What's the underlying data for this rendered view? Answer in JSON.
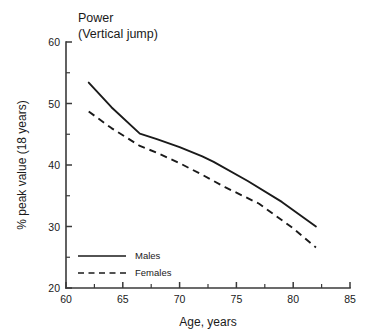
{
  "chart_data": {
    "type": "line",
    "title": "Power",
    "subtitle": "(Vertical jump)",
    "xlabel": "Age, years",
    "ylabel": "% peak value (18 years)",
    "xlim": [
      60,
      85
    ],
    "ylim": [
      20,
      60
    ],
    "xticks": [
      60,
      65,
      70,
      75,
      80,
      85
    ],
    "yticks": [
      20,
      30,
      40,
      50,
      60
    ],
    "xticklabels": [
      "60",
      "65",
      "70",
      "75",
      "80",
      "85"
    ],
    "yticklabels": [
      "20",
      "30",
      "40",
      "50",
      "60"
    ],
    "x_minor_ticks": [
      62.5,
      67.5,
      72.5,
      77.5,
      82.5
    ],
    "y_minor_ticks": [
      25,
      35,
      45,
      55
    ],
    "grid": false,
    "legend_position": "lower-left",
    "series": [
      {
        "name": "Males",
        "style": "solid",
        "color": "#1a1a1a",
        "x": [
          62.0,
          64.0,
          66.5,
          68.0,
          70.0,
          72.0,
          73.0,
          76.0,
          79.0,
          82.0
        ],
        "y": [
          53.4,
          49.4,
          45.1,
          44.2,
          42.9,
          41.4,
          40.5,
          37.4,
          34.0,
          30.0
        ]
      },
      {
        "name": "Females",
        "style": "dashed",
        "color": "#1a1a1a",
        "x": [
          62.0,
          64.0,
          66.5,
          68.0,
          70.0,
          72.0,
          74.0,
          77.0,
          80.0,
          82.0
        ],
        "y": [
          48.7,
          46.0,
          43.1,
          42.0,
          40.3,
          38.4,
          36.4,
          33.7,
          29.7,
          26.6
        ]
      }
    ]
  },
  "legend": {
    "items": [
      {
        "label": "Males",
        "style": "solid"
      },
      {
        "label": "Females",
        "style": "dashed"
      }
    ]
  }
}
